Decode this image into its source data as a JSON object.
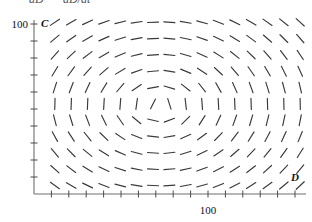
{
  "caption": {
    "left_fragment": "dD",
    "right_fragment": "dD/dt"
  },
  "axes": {
    "x_name": "D",
    "y_name": "C",
    "x_tick_label": "100",
    "y_tick_label": "100"
  },
  "chart_data": {
    "type": "scatter",
    "title": "",
    "subtitle": "",
    "xlabel": "D",
    "ylabel": "C",
    "grid": false,
    "legend": null,
    "xlim": [
      0,
      160
    ],
    "ylim": [
      0,
      120
    ],
    "x_ticks": [
      100
    ],
    "x_tick_labels": [
      "100"
    ],
    "y_ticks": [
      100
    ],
    "y_tick_labels": [
      "100"
    ],
    "field": {
      "kind": "vector-field",
      "description": "Clockwise rotational direction field (center/spiral) about an interior fixed point",
      "center": [
        72,
        52
      ],
      "rotation": "clockwise",
      "columns": 16,
      "rows": 12,
      "x_start": 12,
      "x_step": 9.4,
      "y_start": 5,
      "y_step": 9.6,
      "arrow_length": 11,
      "arrow_head": false
    },
    "origin_pixel": [
      34,
      194
    ],
    "x_axis_pixel_end": 306,
    "y_axis_pixel_top": 20,
    "x100_pixel": 208,
    "y100_pixel": 24,
    "colors": {
      "vector": "#3a3a3a",
      "axis": "#6e6e6e",
      "tick": "#4a4a4a",
      "text": "#111111",
      "background": "#ffffff"
    }
  }
}
